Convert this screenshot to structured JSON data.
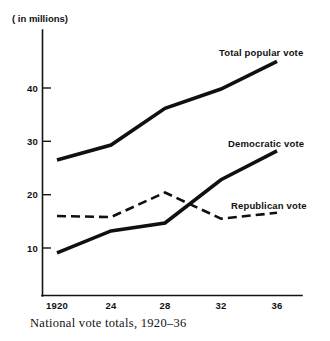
{
  "chart_data": {
    "type": "line",
    "title": "",
    "caption": "National vote totals, 1920–36",
    "unit_note": "( in millions)",
    "xlabel": "",
    "ylabel": "",
    "x": [
      1920,
      1924,
      1928,
      1932,
      1936
    ],
    "categories": [
      "1920",
      "24",
      "28",
      "32",
      "36"
    ],
    "xtick_labels": [
      "1920",
      "24",
      "28",
      "32",
      "36"
    ],
    "ytick_labels": [
      "10",
      "20",
      "30",
      "40"
    ],
    "yticks": [
      10,
      20,
      30,
      40
    ],
    "ylim": [
      0,
      48
    ],
    "xlim": [
      1918.8,
      1937.5
    ],
    "grid": false,
    "legend_position": "inline-right-of-series",
    "series": [
      {
        "name": "Total popular vote",
        "style": "solid",
        "color": "#101010",
        "values": [
          26.5,
          29.3,
          36.2,
          39.8,
          45.0
        ],
        "label": "Total popular vote"
      },
      {
        "name": "Democratic vote",
        "style": "solid",
        "color": "#101010",
        "values": [
          9.1,
          13.2,
          14.7,
          22.8,
          28.2
        ],
        "label": "Democratic vote"
      },
      {
        "name": "Republican vote",
        "style": "dashed",
        "color": "#101010",
        "values": [
          16.0,
          15.8,
          20.4,
          15.5,
          16.6
        ],
        "label": "Republican vote"
      }
    ],
    "annotations": [
      {
        "text": "Total popular vote",
        "x_px": 219,
        "y_px": 52
      },
      {
        "text": "Democratic vote",
        "x_px": 228,
        "y_px": 143
      },
      {
        "text": "Republican vote",
        "x_px": 231,
        "y_px": 205
      }
    ]
  }
}
